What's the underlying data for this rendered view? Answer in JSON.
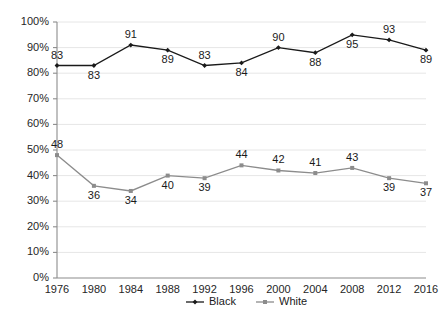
{
  "chart_data": {
    "type": "line",
    "title": "",
    "subtitle": "",
    "xlabel": "",
    "ylabel": "",
    "categories": [
      "1976",
      "1980",
      "1984",
      "1988",
      "1992",
      "1996",
      "2000",
      "2004",
      "2008",
      "2012",
      "2016"
    ],
    "ylim": [
      0,
      100
    ],
    "y_ticks": [
      "0%",
      "10%",
      "20%",
      "30%",
      "40%",
      "50%",
      "60%",
      "70%",
      "80%",
      "90%",
      "100%"
    ],
    "y_tick_values": [
      0,
      10,
      20,
      30,
      40,
      50,
      60,
      70,
      80,
      90,
      100
    ],
    "grid": true,
    "grid_axis": "y",
    "legend_position": "bottom",
    "series": [
      {
        "name": "Black",
        "color": "#1a1a1a",
        "marker": "diamond",
        "values": [
          83,
          83,
          91,
          89,
          83,
          84,
          90,
          88,
          95,
          93,
          89
        ],
        "label_positions": [
          "above",
          "below",
          "above",
          "below",
          "above",
          "below",
          "above",
          "below",
          "below",
          "above",
          "below"
        ]
      },
      {
        "name": "White",
        "color": "#8c8c8c",
        "marker": "square",
        "values": [
          48,
          36,
          34,
          40,
          39,
          44,
          42,
          41,
          43,
          39,
          37
        ],
        "label_positions": [
          "above",
          "below",
          "below",
          "below",
          "below",
          "above",
          "above",
          "above",
          "above",
          "below",
          "below"
        ]
      }
    ],
    "annotations": []
  },
  "legend": {
    "items": [
      {
        "label": "Black"
      },
      {
        "label": "White"
      }
    ]
  },
  "colors": {
    "background": "#ffffff",
    "gridline": "#e6e6e6",
    "axis": "#8c8c8c",
    "text": "#262626",
    "series_black": "#1a1a1a",
    "series_white": "#8c8c8c"
  }
}
